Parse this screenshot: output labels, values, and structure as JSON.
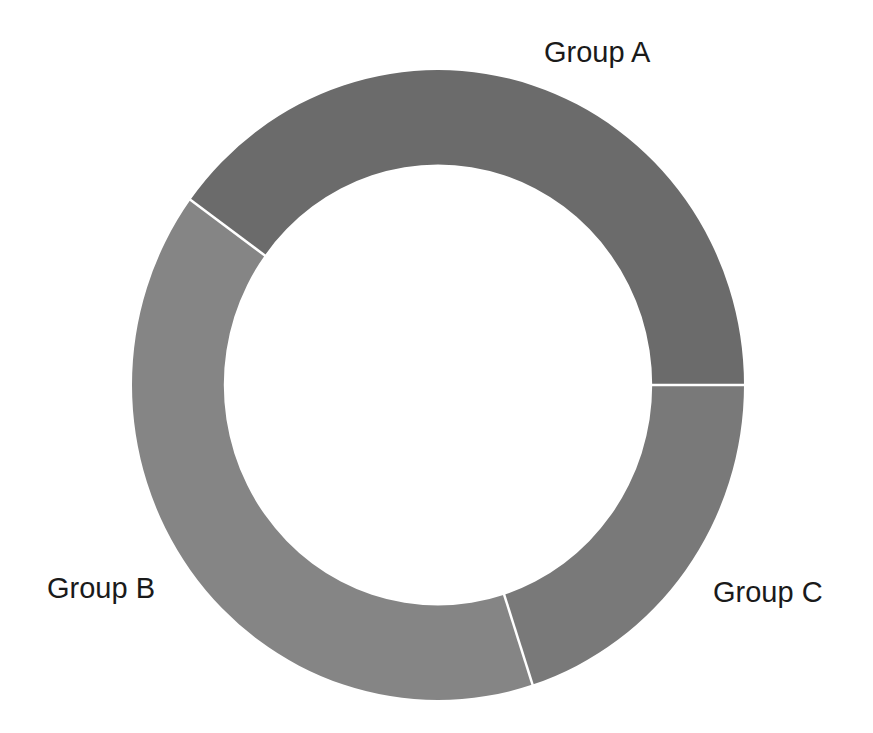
{
  "chart_data": {
    "type": "pie",
    "subtype": "donut",
    "title": "",
    "categories": [
      "Group A",
      "Group B",
      "Group C"
    ],
    "values": [
      40,
      40,
      20
    ],
    "colors": [
      "#6b6b6b",
      "#858585",
      "#797979"
    ],
    "start_angle_deg": 0,
    "direction": "counterclockwise",
    "inner_radius_ratio": 0.7,
    "legend": "none",
    "labels_outside": true
  },
  "layout": {
    "center": [
      438,
      385
    ],
    "outer_radius": [
      306,
      315
    ],
    "separator_color": "#ffffff",
    "label_positions": [
      {
        "x": 544,
        "y": 40
      },
      {
        "x": 47,
        "y": 576
      },
      {
        "x": 713,
        "y": 580
      }
    ]
  }
}
